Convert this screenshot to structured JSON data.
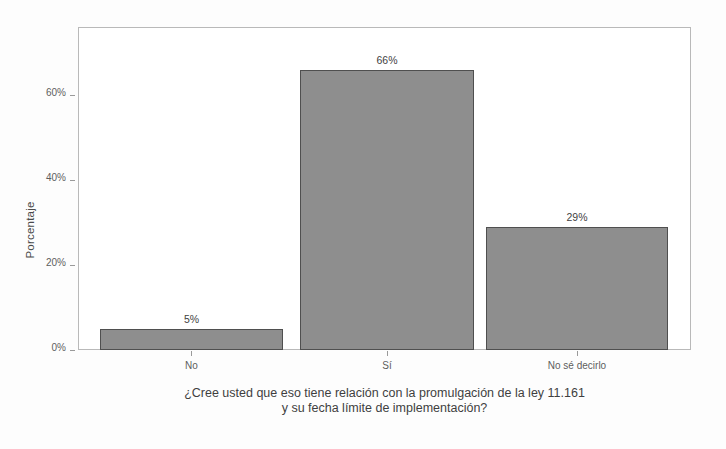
{
  "chart_data": {
    "type": "bar",
    "title": "",
    "xlabel": "¿Cree usted que eso tiene relación con la promulgación de la ley 11.161 y su fecha límite de implementación?",
    "xlabel_lines": [
      "¿Cree usted que eso tiene relación con la promulgación de la ley 11.161",
      "y su fecha límite de implementación?"
    ],
    "ylabel": "Porcentaje",
    "categories": [
      "No",
      "Sí",
      "No sé decirlo"
    ],
    "values": [
      5,
      66,
      29
    ],
    "value_labels": [
      "5%",
      "66%",
      "29%"
    ],
    "ylim": [
      0,
      76
    ],
    "yticks": [
      0,
      20,
      40,
      60
    ],
    "ytick_labels": [
      "0%",
      "20%",
      "40%",
      "60%"
    ],
    "grid": false,
    "legend": null,
    "colors": {
      "bar_fill": "#8e8e8e",
      "bar_border": "#4f4f4f",
      "panel_border": "#b9b9b9",
      "text": "#3f3f3f",
      "tick_text": "#5d5d5d",
      "background": "#ffffff"
    }
  }
}
